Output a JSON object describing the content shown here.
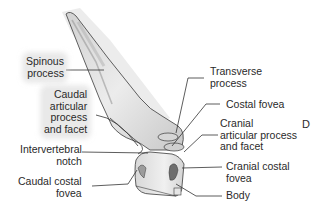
{
  "figure": {
    "panel_letter": "D",
    "labels": {
      "spinous_process": "Spinous\nprocess",
      "caudal_articular": "Caudal\narticular\nprocess\nand facet",
      "intervertebral_notch": "Intervertebral\nnotch",
      "caudal_costal_fovea": "Caudal costal\nfovea",
      "transverse_process": "Transverse\nprocess",
      "costal_fovea": "Costal fovea",
      "cranial_articular": "Cranial\narticular process\nand facet",
      "cranial_costal_fovea": "Cranial costal\nfovea",
      "body": "Body"
    },
    "colors": {
      "bone_fill": "#e9e9e9",
      "bone_shade": "#bdbdbd",
      "outline": "#3a3a3a",
      "leader": "#333333",
      "text": "#2a2a2a"
    }
  }
}
